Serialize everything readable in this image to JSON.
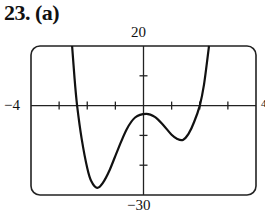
{
  "figure": {
    "label": "23. (a)",
    "ymax_label": "20",
    "ymin_label": "−30",
    "xmin_label": "−4",
    "xmax_label": "4"
  },
  "chart_data": {
    "type": "line",
    "title": "23. (a)",
    "xlabel": "",
    "ylabel": "",
    "xlim": [
      -4,
      4
    ],
    "ylim": [
      -30,
      20
    ],
    "x_ticks": [
      -3,
      -2,
      -1,
      1,
      2,
      3
    ],
    "y_ticks": [
      10,
      -10,
      -20
    ],
    "x_tick_labels": [
      "−4",
      "4"
    ],
    "y_tick_labels": [
      "20",
      "−30"
    ],
    "grid": false,
    "legend": null,
    "series": [
      {
        "name": "f(x)",
        "x": [
          -2.54,
          -2.45,
          -2.36,
          -2.2,
          -2.0,
          -1.85,
          -1.65,
          -1.45,
          -1.2,
          -0.9,
          -0.6,
          -0.3,
          0.1,
          0.4,
          0.7,
          1.0,
          1.2,
          1.4,
          1.6,
          1.8,
          2.0,
          2.15,
          2.33
        ],
        "y": [
          20,
          9,
          0,
          -11,
          -21,
          -25.5,
          -27.6,
          -26,
          -21.5,
          -14.5,
          -8,
          -4,
          -2.8,
          -3.8,
          -6.5,
          -9.8,
          -11.2,
          -11.5,
          -9.5,
          -5.5,
          0,
          7,
          20
        ]
      }
    ],
    "features": {
      "x_intercepts": [
        -2.36,
        2.0
      ],
      "local_min_left": [
        -1.65,
        -27.6
      ],
      "local_max": [
        0.1,
        -2.8
      ],
      "local_min_right": [
        1.4,
        -11.5
      ]
    }
  }
}
